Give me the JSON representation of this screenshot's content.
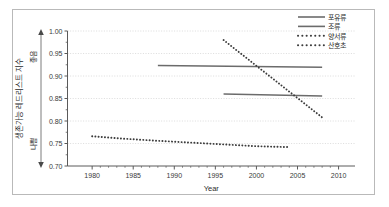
{
  "chart_data": {
    "type": "line",
    "title": "",
    "xlabel": "Year",
    "ylabel": "생존가능 레드리스트 지수",
    "ylabel_top_marker": "좋음",
    "ylabel_bottom_marker": "나쁨",
    "xlim": [
      1977,
      2012
    ],
    "ylim": [
      0.7,
      1.0
    ],
    "xticks": [
      1980,
      1985,
      1990,
      1995,
      2000,
      2005,
      2010
    ],
    "xtick_labels": [
      "1980",
      "1985",
      "1990",
      "1995",
      "2000",
      "2005",
      "2010"
    ],
    "yticks": [
      0.7,
      0.75,
      0.8,
      0.85,
      0.9,
      0.95,
      1.0
    ],
    "ytick_labels": [
      "0.70",
      "0.75",
      "0.80",
      "0.85",
      "0.90",
      "0.95",
      "1.00"
    ],
    "grid": true,
    "grid_axis": "y",
    "legend_position": "top-right",
    "series": [
      {
        "name": "포유류",
        "style": "solid",
        "color": "#6b6b6b",
        "x": [
          1988,
          2008
        ],
        "y": [
          0.9235,
          0.9195
        ]
      },
      {
        "name": "조류",
        "style": "solid",
        "color": "#6b6b6b",
        "x": [
          1996,
          2008
        ],
        "y": [
          0.86,
          0.8555
        ]
      },
      {
        "name": "양서류",
        "style": "dotted",
        "color": "#3c3c3c",
        "x": [
          1996,
          2008
        ],
        "y": [
          0.98,
          0.808
        ]
      },
      {
        "name": "산호초",
        "style": "dotted",
        "color": "#3c3c3c",
        "x": [
          1980,
          1984,
          1988,
          1992,
          1996,
          2000,
          2004
        ],
        "y": [
          0.766,
          0.7605,
          0.756,
          0.752,
          0.748,
          0.744,
          0.742
        ]
      }
    ]
  },
  "legend": {
    "items": [
      {
        "label": "포유류",
        "style": "solid"
      },
      {
        "label": "조류",
        "style": "solid"
      },
      {
        "label": "양서류",
        "style": "dotted"
      },
      {
        "label": "산호초",
        "style": "dotted"
      }
    ]
  },
  "axes": {
    "x_title": "Year",
    "y_title": "생존가능 레드리스트 지수",
    "y_good": "좋음",
    "y_bad": "나쁨"
  }
}
